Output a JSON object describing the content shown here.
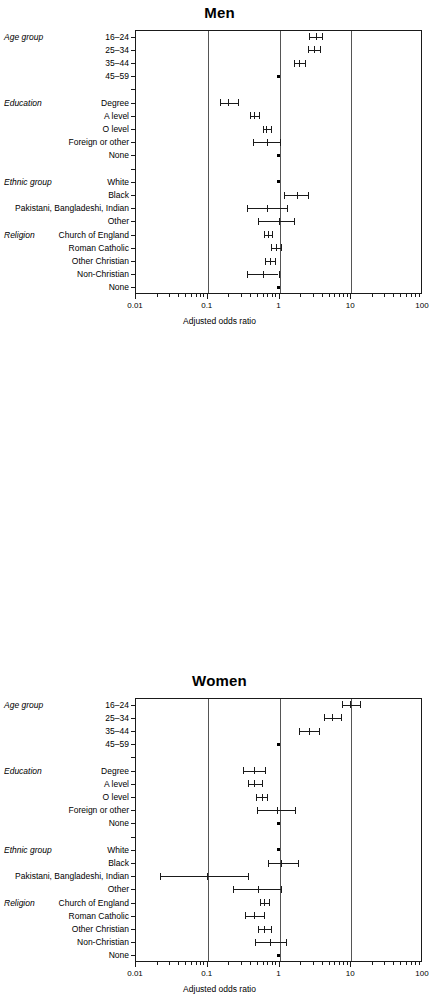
{
  "figure": {
    "axis_title": "Adjusted odds ratio",
    "x_ticks": [
      {
        "label": "0.01",
        "value": 0.01
      },
      {
        "label": "0.1",
        "value": 0.1
      },
      {
        "label": "1",
        "value": 1
      },
      {
        "label": "10",
        "value": 10
      },
      {
        "label": "100",
        "value": 100
      }
    ],
    "gridline_values": [
      0.1,
      1,
      10
    ],
    "group_labels": [
      "Age group",
      "Education",
      "Ethnic group",
      "Religion"
    ]
  },
  "chart_data": [
    {
      "type": "scatter",
      "title": "Men",
      "xlabel": "Adjusted odds ratio",
      "ylabel": "",
      "xscale": "log",
      "xlim": [
        0.01,
        100
      ],
      "grid": true,
      "legend": "none",
      "categories": [
        "16–24",
        "25–34",
        "35–44",
        "45–59",
        "Degree",
        "A level",
        "O level",
        "Foreign or other",
        "None",
        "White",
        "Black",
        "Pakistani, Bangladeshi, Indian",
        "Other",
        "Church of England",
        "Roman Catholic",
        "Other Christian",
        "Non-Christian",
        "None"
      ],
      "groups": [
        {
          "name": "Age group",
          "rows": [
            "16–24",
            "25–34",
            "35–44",
            "45–59"
          ]
        },
        {
          "name": "Education",
          "rows": [
            "Degree",
            "A level",
            "O level",
            "Foreign or other",
            "None"
          ]
        },
        {
          "name": "Ethnic group",
          "rows": [
            "White",
            "Black",
            "Pakistani, Bangladeshi, Indian",
            "Other"
          ]
        },
        {
          "name": "Religion",
          "rows": [
            "Church of England",
            "Roman Catholic",
            "Other Christian",
            "Non-Christian",
            "None"
          ]
        }
      ],
      "points": [
        {
          "row": "16–24",
          "group": "Age group",
          "or": 3.3,
          "lcl": 2.7,
          "ucl": 4.0,
          "reference": false
        },
        {
          "row": "25–34",
          "group": "Age group",
          "or": 3.1,
          "lcl": 2.6,
          "ucl": 3.8,
          "reference": false
        },
        {
          "row": "35–44",
          "group": "Age group",
          "or": 1.95,
          "lcl": 1.62,
          "ucl": 2.35,
          "reference": false
        },
        {
          "row": "45–59",
          "group": "Age group",
          "or": 1.0,
          "lcl": 1.0,
          "ucl": 1.0,
          "reference": true
        },
        {
          "row": "Degree",
          "group": "Education",
          "or": 0.2,
          "lcl": 0.155,
          "ucl": 0.27,
          "reference": false
        },
        {
          "row": "A level",
          "group": "Education",
          "or": 0.46,
          "lcl": 0.4,
          "ucl": 0.53,
          "reference": false
        },
        {
          "row": "O level",
          "group": "Education",
          "or": 0.68,
          "lcl": 0.6,
          "ucl": 0.79,
          "reference": false
        },
        {
          "row": "Foreign or other",
          "group": "Education",
          "or": 0.7,
          "lcl": 0.44,
          "ucl": 1.05,
          "reference": false
        },
        {
          "row": "None",
          "group": "Education",
          "or": 1.0,
          "lcl": 1.0,
          "ucl": 1.0,
          "reference": true
        },
        {
          "row": "White",
          "group": "Ethnic group",
          "or": 1.0,
          "lcl": 1.0,
          "ucl": 1.0,
          "reference": true
        },
        {
          "row": "Black",
          "group": "Ethnic group",
          "or": 1.8,
          "lcl": 1.18,
          "ucl": 2.6,
          "reference": false
        },
        {
          "row": "Pakistani, Bangladeshi, Indian",
          "group": "Ethnic group",
          "or": 0.7,
          "lcl": 0.36,
          "ucl": 1.32,
          "reference": false
        },
        {
          "row": "Other",
          "group": "Ethnic group",
          "or": 1.0,
          "lcl": 0.52,
          "ucl": 1.62,
          "reference": false
        },
        {
          "row": "Church of England",
          "group": "Religion",
          "or": 0.72,
          "lcl": 0.63,
          "ucl": 0.82,
          "reference": false
        },
        {
          "row": "Roman Catholic",
          "group": "Religion",
          "or": 0.92,
          "lcl": 0.78,
          "ucl": 1.1,
          "reference": false
        },
        {
          "row": "Other Christian",
          "group": "Religion",
          "or": 0.76,
          "lcl": 0.64,
          "ucl": 0.9,
          "reference": false
        },
        {
          "row": "Non-Christian",
          "group": "Religion",
          "or": 0.6,
          "lcl": 0.36,
          "ucl": 1.0,
          "reference": false
        },
        {
          "row": "None",
          "group": "Religion",
          "or": 1.0,
          "lcl": 1.0,
          "ucl": 1.0,
          "reference": true
        }
      ]
    },
    {
      "type": "scatter",
      "title": "Women",
      "xlabel": "Adjusted odds ratio",
      "ylabel": "",
      "xscale": "log",
      "xlim": [
        0.01,
        100
      ],
      "grid": true,
      "legend": "none",
      "categories": [
        "16–24",
        "25–34",
        "35–44",
        "45–59",
        "Degree",
        "A level",
        "O level",
        "Foreign or other",
        "None",
        "White",
        "Black",
        "Pakistani, Bangladeshi, Indian",
        "Other",
        "Church of England",
        "Roman Catholic",
        "Other Christian",
        "Non-Christian",
        "None"
      ],
      "groups": [
        {
          "name": "Age group",
          "rows": [
            "16–24",
            "25–34",
            "35–44",
            "45–59"
          ]
        },
        {
          "name": "Education",
          "rows": [
            "Degree",
            "A level",
            "O level",
            "Foreign or other",
            "None"
          ]
        },
        {
          "name": "Ethnic group",
          "rows": [
            "White",
            "Black",
            "Pakistani, Bangladeshi, Indian",
            "Other"
          ]
        },
        {
          "name": "Religion",
          "rows": [
            "Church of England",
            "Roman Catholic",
            "Other Christian",
            "Non-Christian",
            "None"
          ]
        }
      ],
      "points": [
        {
          "row": "16–24",
          "group": "Age group",
          "or": 10.0,
          "lcl": 7.6,
          "ucl": 13.5,
          "reference": false
        },
        {
          "row": "25–34",
          "group": "Age group",
          "or": 5.6,
          "lcl": 4.3,
          "ucl": 7.4,
          "reference": false
        },
        {
          "row": "35–44",
          "group": "Age group",
          "or": 2.7,
          "lcl": 1.9,
          "ucl": 3.7,
          "reference": false
        },
        {
          "row": "45–59",
          "group": "Age group",
          "or": 1.0,
          "lcl": 1.0,
          "ucl": 1.0,
          "reference": true
        },
        {
          "row": "Degree",
          "group": "Education",
          "or": 0.45,
          "lcl": 0.32,
          "ucl": 0.64,
          "reference": false
        },
        {
          "row": "A level",
          "group": "Education",
          "or": 0.46,
          "lcl": 0.37,
          "ucl": 0.58,
          "reference": false
        },
        {
          "row": "O level",
          "group": "Education",
          "or": 0.58,
          "lcl": 0.48,
          "ucl": 0.7,
          "reference": false
        },
        {
          "row": "Foreign or other",
          "group": "Education",
          "or": 0.95,
          "lcl": 0.5,
          "ucl": 1.7,
          "reference": false
        },
        {
          "row": "None",
          "group": "Education",
          "or": 1.0,
          "lcl": 1.0,
          "ucl": 1.0,
          "reference": true
        },
        {
          "row": "White",
          "group": "Ethnic group",
          "or": 1.0,
          "lcl": 1.0,
          "ucl": 1.0,
          "reference": true
        },
        {
          "row": "Black",
          "group": "Ethnic group",
          "or": 1.1,
          "lcl": 0.72,
          "ucl": 1.85,
          "reference": false
        },
        {
          "row": "Pakistani, Bangladeshi, Indian",
          "group": "Ethnic group",
          "or": 0.1,
          "lcl": 0.022,
          "ucl": 0.38,
          "reference": false
        },
        {
          "row": "Other",
          "group": "Ethnic group",
          "or": 0.52,
          "lcl": 0.23,
          "ucl": 1.1,
          "reference": false
        },
        {
          "row": "Church of England",
          "group": "Religion",
          "or": 0.63,
          "lcl": 0.55,
          "ucl": 0.74,
          "reference": false
        },
        {
          "row": "Roman Catholic",
          "group": "Religion",
          "or": 0.46,
          "lcl": 0.34,
          "ucl": 0.62,
          "reference": false
        },
        {
          "row": "Other Christian",
          "group": "Religion",
          "or": 0.63,
          "lcl": 0.52,
          "ucl": 0.78,
          "reference": false
        },
        {
          "row": "Non-Christian",
          "group": "Religion",
          "or": 0.77,
          "lcl": 0.47,
          "ucl": 1.28,
          "reference": false
        },
        {
          "row": "None",
          "group": "Religion",
          "or": 1.0,
          "lcl": 1.0,
          "ucl": 1.0,
          "reference": true
        }
      ]
    }
  ]
}
